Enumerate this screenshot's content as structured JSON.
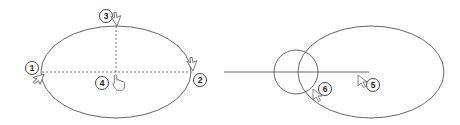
{
  "diagram": {
    "left_panel": {
      "shape": "ellipse",
      "description": "Ellipse defined by center and axis endpoints",
      "callouts": [
        {
          "label": "1",
          "role": "axis endpoint (left)"
        },
        {
          "label": "2",
          "role": "axis endpoint (right)"
        },
        {
          "label": "3",
          "role": "second axis endpoint (top)"
        },
        {
          "label": "4",
          "role": "center"
        }
      ]
    },
    "right_panel": {
      "shape": "ellipse with intersecting circle and line",
      "callouts": [
        {
          "label": "5",
          "role": "pick point"
        },
        {
          "label": "6",
          "role": "pick point on intersection"
        }
      ]
    },
    "colors": {
      "stroke": "#555555",
      "background": "#ffffff",
      "callout_fill": "#ffffff"
    }
  }
}
